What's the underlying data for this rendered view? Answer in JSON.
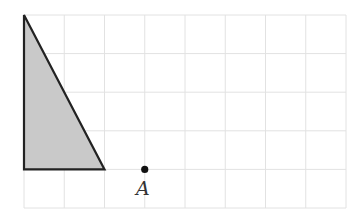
{
  "diagram": {
    "type": "grid-geometry",
    "grid": {
      "columns": 8,
      "rows": 5,
      "origin_px": [
        24,
        15
      ],
      "cell_w_px": 40.25,
      "cell_h_px": 38.6,
      "line_color": "#e2e2e2"
    },
    "shapes": [
      {
        "name": "right-triangle",
        "vertices_grid": [
          [
            0,
            0
          ],
          [
            0,
            4
          ],
          [
            2,
            4
          ]
        ],
        "fill": "#c9c9c9",
        "stroke": "#222222"
      }
    ],
    "points": [
      {
        "label": "A",
        "grid": [
          3,
          4
        ],
        "color": "#111111"
      }
    ]
  }
}
